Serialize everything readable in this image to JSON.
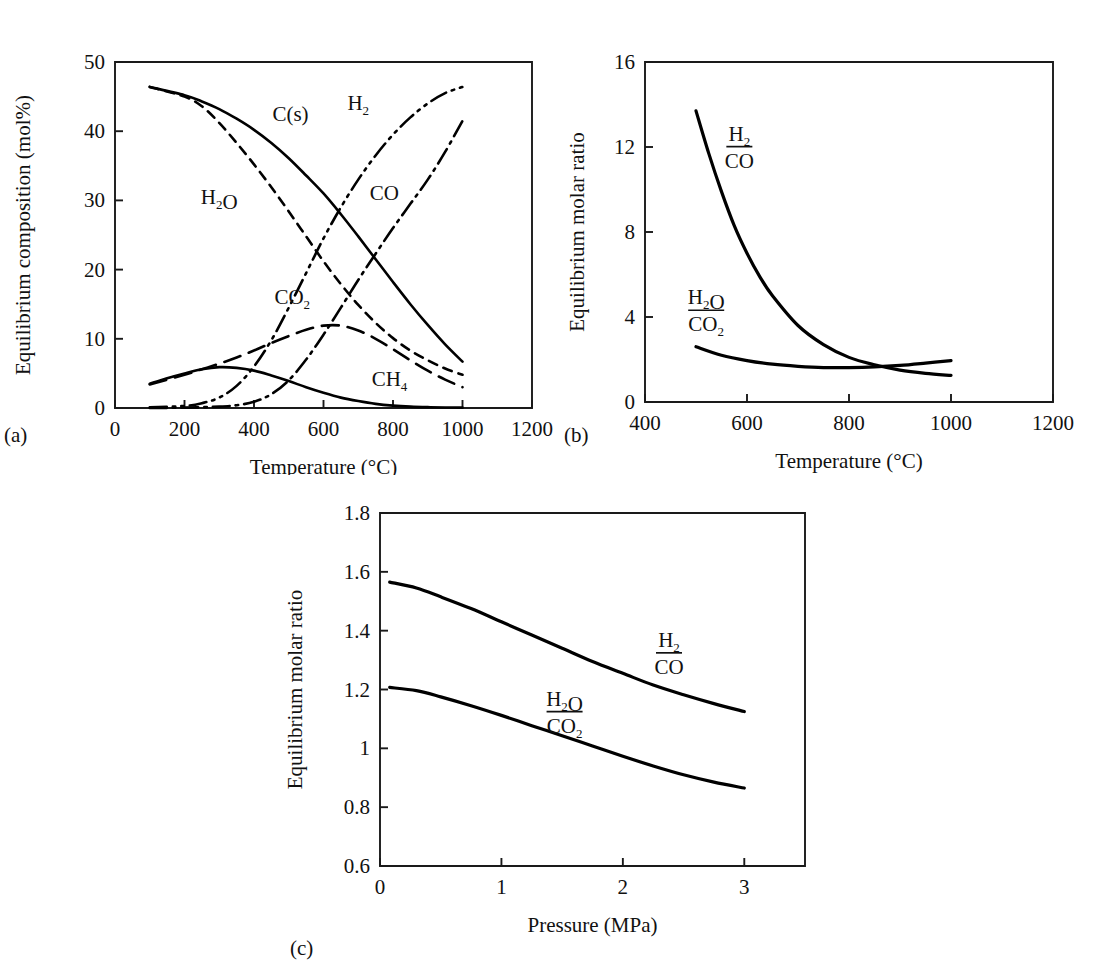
{
  "figure": {
    "background": "#ffffff",
    "ink": "#000000",
    "panels": [
      "a",
      "b",
      "c"
    ]
  },
  "chart_data": [
    {
      "id": "a",
      "tag": "(a)",
      "type": "line",
      "title": "",
      "xlabel": "Temperature (°C)",
      "ylabel": "Equilibrium composition (mol%)",
      "xlim": [
        0,
        1200
      ],
      "ylim": [
        0,
        50
      ],
      "xticks": [
        0,
        200,
        400,
        600,
        800,
        1000,
        1200
      ],
      "xticklabels": [
        "0",
        "200",
        "400",
        "600",
        "800",
        "1000",
        "1200"
      ],
      "yticks": [
        0,
        10,
        20,
        30,
        40,
        50
      ],
      "yticklabels": [
        "0",
        "10",
        "20",
        "30",
        "40",
        "50"
      ],
      "grid": false,
      "legend": "inline-labels",
      "series": [
        {
          "name": "C(s)",
          "label_html": "C<sub>(s)</sub>",
          "label_x": 505,
          "label_y": 41.5,
          "linestyle": "solid",
          "x": [
            100,
            200,
            250,
            300,
            350,
            400,
            450,
            500,
            550,
            600,
            650,
            700,
            750,
            800,
            850,
            900,
            950,
            1000
          ],
          "values": [
            46.4,
            45.2,
            44.3,
            43.2,
            41.8,
            40.2,
            38.3,
            36.1,
            33.6,
            31.0,
            28.0,
            24.8,
            21.5,
            18.2,
            15.0,
            12.0,
            9.2,
            6.7
          ]
        },
        {
          "name": "H2O",
          "label_html": "H<sub>2</sub>O",
          "label_x": 300,
          "label_y": 29.5,
          "linestyle": "dashed",
          "x": [
            100,
            200,
            250,
            300,
            350,
            400,
            450,
            500,
            550,
            600,
            650,
            700,
            750,
            800,
            850,
            900,
            950,
            1000
          ],
          "values": [
            46.4,
            45.0,
            43.6,
            41.2,
            38.3,
            35.2,
            31.9,
            28.4,
            24.8,
            21.2,
            17.9,
            14.9,
            12.3,
            10.1,
            8.3,
            6.9,
            5.7,
            4.8
          ]
        },
        {
          "name": "H2",
          "label_html": "H<sub>2</sub>",
          "label_x": 700,
          "label_y": 43.0,
          "linestyle": "dashdotdot",
          "x": [
            100,
            200,
            250,
            300,
            350,
            400,
            450,
            500,
            550,
            600,
            650,
            700,
            750,
            800,
            850,
            900,
            950,
            1000
          ],
          "values": [
            0.1,
            0.3,
            0.7,
            1.5,
            3.2,
            6.0,
            9.8,
            14.5,
            19.5,
            24.5,
            29.0,
            33.0,
            36.5,
            39.5,
            42.0,
            44.0,
            45.5,
            46.4
          ]
        },
        {
          "name": "CO",
          "label_html": "CO",
          "label_x": 775,
          "label_y": 30.0,
          "linestyle": "dashdot",
          "x": [
            100,
            200,
            300,
            350,
            400,
            450,
            500,
            550,
            600,
            650,
            700,
            750,
            800,
            850,
            900,
            950,
            1000
          ],
          "values": [
            0.0,
            0.05,
            0.2,
            0.4,
            0.9,
            2.0,
            4.0,
            7.0,
            10.6,
            14.5,
            18.5,
            22.3,
            26.0,
            29.5,
            33.0,
            37.0,
            41.5
          ]
        },
        {
          "name": "CO2",
          "label_html": "CO<sub>2</sub>",
          "label_x": 510,
          "label_y": 15.0,
          "linestyle": "longdash",
          "x": [
            100,
            200,
            250,
            300,
            350,
            400,
            450,
            500,
            550,
            600,
            650,
            700,
            750,
            800,
            850,
            900,
            950,
            1000
          ],
          "values": [
            3.4,
            4.8,
            5.6,
            6.4,
            7.3,
            8.3,
            9.4,
            10.4,
            11.3,
            11.9,
            11.9,
            11.2,
            10.0,
            8.5,
            6.9,
            5.4,
            4.1,
            3.0
          ]
        },
        {
          "name": "CH4",
          "label_html": "CH<sub>4</sub>",
          "label_x": 790,
          "label_y": 3.2,
          "linestyle": "solid",
          "x": [
            100,
            150,
            200,
            250,
            300,
            350,
            400,
            450,
            500,
            550,
            600,
            650,
            700,
            750,
            800,
            850,
            900,
            950,
            1000
          ],
          "values": [
            3.5,
            4.3,
            5.0,
            5.6,
            5.9,
            5.8,
            5.4,
            4.7,
            3.9,
            3.0,
            2.2,
            1.5,
            1.0,
            0.6,
            0.35,
            0.2,
            0.12,
            0.08,
            0.05
          ]
        }
      ]
    },
    {
      "id": "b",
      "tag": "(b)",
      "type": "line",
      "title": "",
      "xlabel": "Temperature (°C)",
      "ylabel": "Equilibrium molar ratio",
      "xlim": [
        400,
        1200
      ],
      "ylim": [
        0,
        16
      ],
      "xticks": [
        400,
        600,
        800,
        1000,
        1200
      ],
      "xticklabels": [
        "400",
        "600",
        "800",
        "1000",
        "1200"
      ],
      "yticks": [
        0,
        4,
        8,
        12,
        16
      ],
      "yticklabels": [
        "0",
        "4",
        "8",
        "12",
        "16"
      ],
      "grid": false,
      "legend": "inline-labels",
      "series": [
        {
          "name": "H2/CO",
          "numerator": "H2",
          "denominator": "CO",
          "label_x": 585,
          "label_y": 12.3,
          "linestyle": "solid",
          "x": [
            500,
            525,
            550,
            575,
            600,
            625,
            650,
            700,
            750,
            800,
            850,
            900,
            950,
            1000
          ],
          "values": [
            13.7,
            11.7,
            9.9,
            8.3,
            7.0,
            5.9,
            5.0,
            3.6,
            2.7,
            2.1,
            1.75,
            1.5,
            1.35,
            1.25
          ]
        },
        {
          "name": "H2O/CO2",
          "numerator": "H2O",
          "denominator": "CO2",
          "label_x": 520,
          "label_y": 4.6,
          "linestyle": "solid",
          "x": [
            500,
            550,
            600,
            650,
            700,
            750,
            800,
            850,
            900,
            950,
            1000
          ],
          "values": [
            2.6,
            2.2,
            1.95,
            1.78,
            1.68,
            1.62,
            1.62,
            1.65,
            1.72,
            1.83,
            1.95
          ]
        }
      ]
    },
    {
      "id": "c",
      "tag": "(c)",
      "type": "line",
      "title": "",
      "xlabel": "Pressure (MPa)",
      "ylabel": "Equilibrium molar ratio",
      "xlim": [
        0,
        3.5
      ],
      "ylim": [
        0.6,
        1.8
      ],
      "xticks": [
        0,
        1,
        2,
        3
      ],
      "xticklabels": [
        "0",
        "1",
        "2",
        "3"
      ],
      "yticks": [
        0.6,
        0.8,
        1.0,
        1.2,
        1.4,
        1.6,
        1.8
      ],
      "yticklabels": [
        "0.6",
        "0.8",
        "1",
        "1.2",
        "1.4",
        "1.6",
        "1.8"
      ],
      "grid": false,
      "legend": "inline-labels",
      "series": [
        {
          "name": "H2/CO",
          "numerator": "H2",
          "denominator": "CO",
          "label_x": 2.38,
          "label_y": 1.345,
          "linestyle": "solid",
          "x": [
            0.08,
            0.3,
            0.5,
            0.75,
            1.0,
            1.25,
            1.5,
            1.75,
            2.0,
            2.25,
            2.5,
            2.75,
            3.0
          ],
          "values": [
            1.565,
            1.545,
            1.515,
            1.475,
            1.43,
            1.385,
            1.34,
            1.295,
            1.255,
            1.215,
            1.182,
            1.152,
            1.125
          ]
        },
        {
          "name": "H2O/CO2",
          "numerator": "H2O",
          "denominator": "CO2",
          "label_x": 1.52,
          "label_y": 1.145,
          "linestyle": "solid",
          "x": [
            0.08,
            0.3,
            0.5,
            0.75,
            1.0,
            1.25,
            1.5,
            1.75,
            2.0,
            2.25,
            2.5,
            2.75,
            3.0
          ],
          "values": [
            1.207,
            1.196,
            1.175,
            1.145,
            1.112,
            1.077,
            1.043,
            1.008,
            0.973,
            0.94,
            0.91,
            0.885,
            0.865
          ]
        }
      ]
    }
  ]
}
